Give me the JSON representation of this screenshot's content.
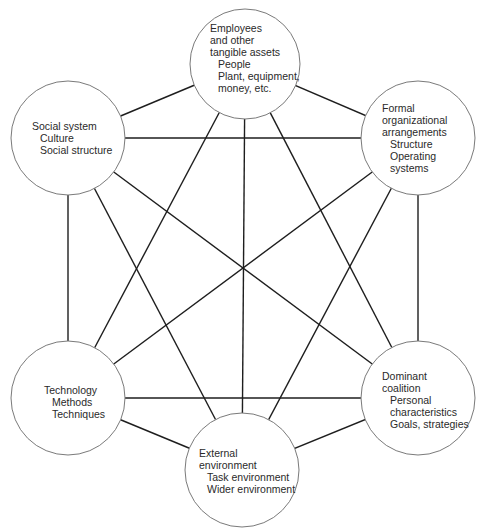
{
  "diagram": {
    "type": "complete-graph",
    "line_color": "#1e1e1e",
    "circle_stroke": "#7a7a7a",
    "background": "#ffffff",
    "nodes": [
      {
        "id": "employees",
        "cx": 245,
        "cy": 64,
        "r": 55,
        "title_lines": [
          "Employees",
          "and other",
          "tangible assets"
        ],
        "items": [
          "People",
          "Plant, equipment,"
        ],
        "extra_lines": [
          "money, etc."
        ]
      },
      {
        "id": "social",
        "cx": 68,
        "cy": 138,
        "r": 57,
        "title_lines": [
          "Social system"
        ],
        "items": [
          "Culture",
          "Social structure"
        ],
        "extra_lines": []
      },
      {
        "id": "formal",
        "cx": 418,
        "cy": 138,
        "r": 57,
        "title_lines": [
          "Formal",
          "organizational",
          "arrangements"
        ],
        "items": [
          "Structure",
          "Operating",
          "systems"
        ],
        "extra_lines": []
      },
      {
        "id": "technology",
        "cx": 68,
        "cy": 398,
        "r": 57,
        "title_lines": [
          "Technology"
        ],
        "items": [
          "Methods",
          "Techniques"
        ],
        "extra_lines": []
      },
      {
        "id": "dominant",
        "cx": 418,
        "cy": 398,
        "r": 57,
        "title_lines": [
          "Dominant",
          "coalition"
        ],
        "items": [
          "Personal",
          "characteristics",
          "Goals, strategies"
        ],
        "extra_lines": []
      },
      {
        "id": "external",
        "cx": 242,
        "cy": 470,
        "r": 57,
        "title_lines": [
          "External",
          "environment"
        ],
        "items": [
          "Task environment",
          "Wider environment"
        ],
        "extra_lines": []
      }
    ],
    "edges": [
      [
        "employees",
        "social"
      ],
      [
        "employees",
        "formal"
      ],
      [
        "employees",
        "technology"
      ],
      [
        "employees",
        "dominant"
      ],
      [
        "employees",
        "external"
      ],
      [
        "social",
        "formal"
      ],
      [
        "social",
        "technology"
      ],
      [
        "social",
        "dominant"
      ],
      [
        "social",
        "external"
      ],
      [
        "formal",
        "technology"
      ],
      [
        "formal",
        "dominant"
      ],
      [
        "formal",
        "external"
      ],
      [
        "technology",
        "dominant"
      ],
      [
        "technology",
        "external"
      ],
      [
        "dominant",
        "external"
      ]
    ]
  },
  "labels": {
    "employees": {
      "l1": "Employees",
      "l2": "and other",
      "l3": "tangible assets",
      "l4": "People",
      "l5": "Plant, equipment,",
      "l6": "money, etc."
    },
    "social": {
      "l1": "Social system",
      "l2": "Culture",
      "l3": "Social structure"
    },
    "formal": {
      "l1": "Formal",
      "l2": "organizational",
      "l3": "arrangements",
      "l4": "Structure",
      "l5": "Operating",
      "l6": "systems"
    },
    "technology": {
      "l1": "Technology",
      "l2": "Methods",
      "l3": "Techniques"
    },
    "dominant": {
      "l1": "Dominant",
      "l2": "coalition",
      "l3": "Personal",
      "l4": "characteristics",
      "l5": "Goals, strategies"
    },
    "external": {
      "l1": "External",
      "l2": "environment",
      "l3": "Task environment",
      "l4": "Wider environment"
    }
  }
}
